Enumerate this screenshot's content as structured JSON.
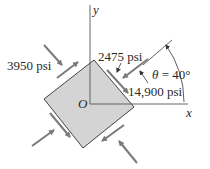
{
  "diagram": {
    "type": "stress-element",
    "axes": {
      "x_label": "x",
      "y_label": "y",
      "origin_label": "O"
    },
    "stresses": {
      "normal_compressive_1": "3950 psi",
      "shear": "2475 psi",
      "normal_compressive_2": "14,900 psi"
    },
    "angle": {
      "symbol": "θ",
      "equals": "=",
      "value": "40°",
      "full": "θ = 40°"
    },
    "colors": {
      "element_fill": "#d4d4d4",
      "element_stroke": "#444444",
      "arrow": "#7a7a7a",
      "axis": "#555555",
      "text": "#2a2a2a"
    }
  }
}
